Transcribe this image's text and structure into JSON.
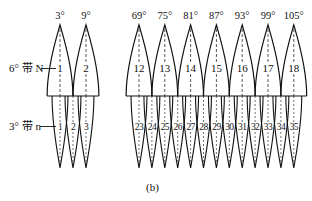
{
  "diagram": {
    "caption": "(b)",
    "six_degree_label": "6° 带 N",
    "three_degree_label": "3° 带 n",
    "six_degree_zones": [
      {
        "number": "1",
        "central_meridian": "3°"
      },
      {
        "number": "2",
        "central_meridian": "9°"
      },
      {
        "number": "12",
        "central_meridian": "69°"
      },
      {
        "number": "13",
        "central_meridian": "75°"
      },
      {
        "number": "14",
        "central_meridian": "81°"
      },
      {
        "number": "15",
        "central_meridian": "87°"
      },
      {
        "number": "16",
        "central_meridian": "93°"
      },
      {
        "number": "17",
        "central_meridian": "99°"
      },
      {
        "number": "18",
        "central_meridian": "105°"
      }
    ],
    "three_degree_zones": [
      "1",
      "2",
      "3",
      "23",
      "24",
      "25",
      "26",
      "27",
      "28",
      "29",
      "30",
      "31",
      "32",
      "33",
      "34",
      "35"
    ],
    "line_color": "#111111",
    "background": "#ffffff"
  }
}
